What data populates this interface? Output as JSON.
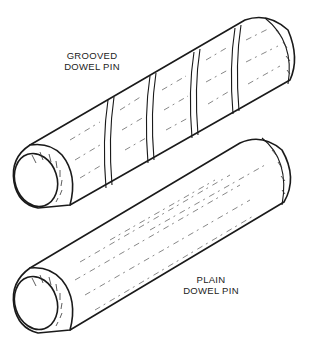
{
  "figure": {
    "colors": {
      "line": "#1a1a1a",
      "background": "#ffffff"
    }
  },
  "labels": {
    "grooved": {
      "line1": "GROOVED",
      "line2": "DOWEL PIN"
    },
    "plain": {
      "line1": "PLAIN",
      "line2": "DOWEL PIN"
    }
  },
  "parts": [
    {
      "name": "grooved-dowel-pin",
      "grooves": 4
    },
    {
      "name": "plain-dowel-pin",
      "grooves": 0
    }
  ]
}
